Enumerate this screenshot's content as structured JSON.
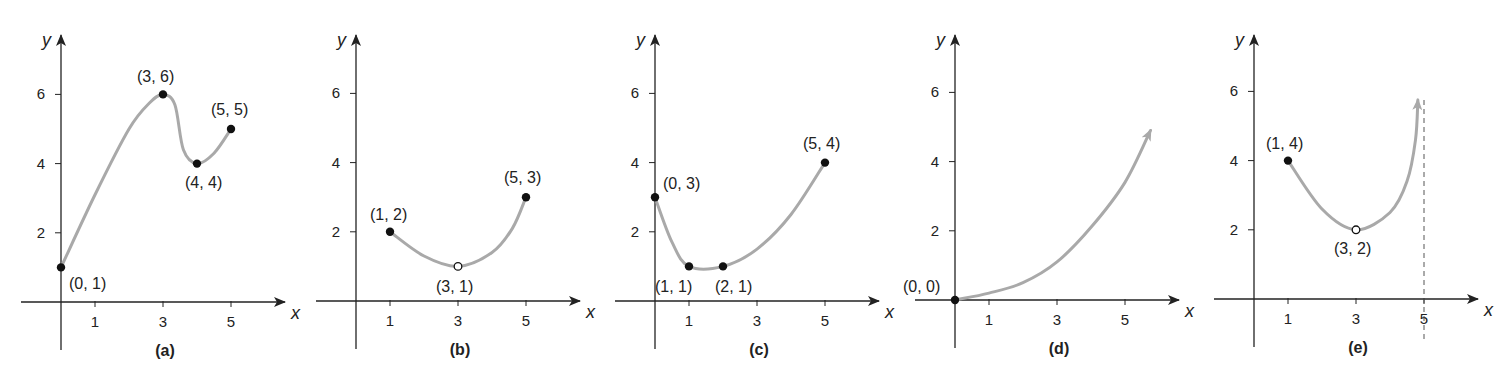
{
  "figure": {
    "cropped_header_text": "Figure",
    "colors": {
      "axis": "#222222",
      "curve": "#a9a9a9",
      "point": "#111111",
      "text": "#222222",
      "background": "#ffffff"
    }
  },
  "chart_data": [
    {
      "type": "line",
      "panel": "(a)",
      "xlabel": "x",
      "ylabel": "y",
      "x_ticks": [
        1,
        3,
        5
      ],
      "y_ticks": [
        2,
        4,
        6
      ],
      "xlim": [
        -0.6,
        6.5
      ],
      "ylim": [
        -1.4,
        7.7
      ],
      "grid": false,
      "curve": [
        [
          0,
          1
        ],
        [
          1,
          3.1
        ],
        [
          2,
          5
        ],
        [
          2.6,
          5.75
        ],
        [
          3,
          6
        ],
        [
          3.35,
          5.7
        ],
        [
          3.6,
          4.4
        ],
        [
          4,
          4
        ],
        [
          4.5,
          4.3
        ],
        [
          5,
          5
        ]
      ],
      "points": [
        {
          "x": 0,
          "y": 1,
          "label": "(0, 1)",
          "filled": true
        },
        {
          "x": 3,
          "y": 6,
          "label": "(3, 6)",
          "filled": true
        },
        {
          "x": 4,
          "y": 4,
          "label": "(4, 4)",
          "filled": true
        },
        {
          "x": 5,
          "y": 5,
          "label": "(5, 5)",
          "filled": true
        }
      ],
      "arrow_end": false,
      "asymptote_x": null
    },
    {
      "type": "line",
      "panel": "(b)",
      "xlabel": "x",
      "ylabel": "y",
      "x_ticks": [
        1,
        3,
        5
      ],
      "y_ticks": [
        2,
        4,
        6
      ],
      "xlim": [
        -0.6,
        6.5
      ],
      "ylim": [
        -1.4,
        7.7
      ],
      "grid": false,
      "curve": [
        [
          1,
          2
        ],
        [
          2,
          1.3
        ],
        [
          3,
          1
        ],
        [
          4,
          1.4
        ],
        [
          4.6,
          2.1
        ],
        [
          5,
          3
        ]
      ],
      "points": [
        {
          "x": 1,
          "y": 2,
          "label": "(1, 2)",
          "filled": true
        },
        {
          "x": 3,
          "y": 1,
          "label": "(3, 1)",
          "filled": false
        },
        {
          "x": 5,
          "y": 3,
          "label": "(5, 3)",
          "filled": true
        }
      ],
      "arrow_end": false,
      "asymptote_x": null
    },
    {
      "type": "line",
      "panel": "(c)",
      "xlabel": "x",
      "ylabel": "y",
      "x_ticks": [
        1,
        3,
        5
      ],
      "y_ticks": [
        2,
        4,
        6
      ],
      "xlim": [
        -0.6,
        6.5
      ],
      "ylim": [
        -1.4,
        7.7
      ],
      "grid": false,
      "curve": [
        [
          0,
          3
        ],
        [
          0.5,
          1.7
        ],
        [
          1,
          1
        ],
        [
          2,
          1
        ],
        [
          3,
          1.5
        ],
        [
          4,
          2.5
        ],
        [
          5,
          4
        ]
      ],
      "points": [
        {
          "x": 0,
          "y": 3,
          "label": "(0, 3)",
          "filled": true
        },
        {
          "x": 1,
          "y": 1,
          "label": "(1, 1)",
          "filled": true
        },
        {
          "x": 2,
          "y": 1,
          "label": "(2, 1)",
          "filled": true
        },
        {
          "x": 5,
          "y": 4,
          "label": "(5, 4)",
          "filled": true
        }
      ],
      "arrow_end": false,
      "asymptote_x": null
    },
    {
      "type": "line",
      "panel": "(d)",
      "xlabel": "x",
      "ylabel": "y",
      "x_ticks": [
        1,
        3,
        5
      ],
      "y_ticks": [
        2,
        4,
        6
      ],
      "xlim": [
        -0.6,
        6.5
      ],
      "ylim": [
        -1.4,
        7.7
      ],
      "grid": false,
      "curve": [
        [
          0,
          0
        ],
        [
          1,
          0.2
        ],
        [
          2,
          0.5
        ],
        [
          3,
          1.1
        ],
        [
          4,
          2.1
        ],
        [
          5,
          3.4
        ],
        [
          5.75,
          4.9
        ]
      ],
      "points": [
        {
          "x": 0,
          "y": 0,
          "label": "(0, 0)",
          "filled": true
        }
      ],
      "arrow_end": true,
      "asymptote_x": null
    },
    {
      "type": "line",
      "panel": "(e)",
      "xlabel": "x",
      "ylabel": "y",
      "x_ticks": [
        1,
        3,
        5
      ],
      "y_ticks": [
        2,
        4,
        6
      ],
      "xlim": [
        -0.6,
        6.5
      ],
      "ylim": [
        -1.4,
        7.7
      ],
      "grid": false,
      "curve": [
        [
          1,
          4
        ],
        [
          2,
          2.6
        ],
        [
          3,
          2
        ],
        [
          4,
          2.5
        ],
        [
          4.5,
          3.4
        ],
        [
          4.75,
          4.6
        ],
        [
          4.82,
          5.75
        ]
      ],
      "points": [
        {
          "x": 1,
          "y": 4,
          "label": "(1, 4)",
          "filled": true
        },
        {
          "x": 3,
          "y": 2,
          "label": "(3, 2)",
          "filled": false
        }
      ],
      "arrow_end": true,
      "asymptote_x": 5
    }
  ]
}
